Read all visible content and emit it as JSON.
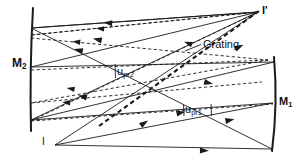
{
  "figure": {
    "kind": "optical-ray-diagram",
    "background_color": "#ffffff",
    "ink_color": "#1a1a1a"
  },
  "labels": {
    "mirror_left": {
      "base": "M",
      "sub": "2",
      "text": "M2"
    },
    "mirror_right": {
      "base": "M",
      "sub": "1",
      "text": "M1"
    },
    "source": "I",
    "image": "I'",
    "grating": "Grating",
    "angle_upper": {
      "base": "u",
      "sub": "pr2",
      "text": "upr2"
    },
    "angle_lower": {
      "base": "u",
      "sub": "pr1",
      "text": "upr1"
    }
  },
  "elements": {
    "mirror_left_name": "M2 concave mirror",
    "mirror_right_name": "M1 concave mirror",
    "grating_name": "diffraction grating",
    "source_point_name": "object point I",
    "image_point_name": "image point I prime"
  },
  "geometry": {
    "mirror_left": {
      "x_top": 33,
      "y_top": 8,
      "x_bottom": 31,
      "y_bottom": 131,
      "bow": 3
    },
    "mirror_right": {
      "x_top": 274,
      "y_top": 57,
      "x_bottom": 272,
      "y_bottom": 151,
      "bow": 3
    },
    "grating_line": {
      "x1": 99,
      "y1": 126,
      "x2": 259,
      "y2": 11
    },
    "source_point": {
      "x": 55,
      "y": 145
    },
    "image_point": {
      "x": 258,
      "y": 12
    }
  },
  "line_styles": {
    "solid_label": "solid ray",
    "dashed_label": "dashed ray",
    "grating_label": "heavy dashed grating"
  }
}
